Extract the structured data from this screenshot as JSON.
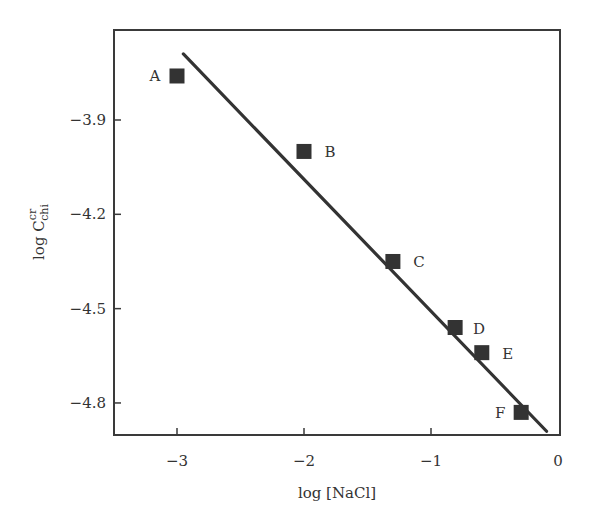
{
  "chart_data": {
    "type": "scatter",
    "title": "",
    "xlabel": "log [NaCl]",
    "ylabel": "log C_chi^cr",
    "ylabel_parts": {
      "base": "log C",
      "sup": "cr",
      "sub": "chi"
    },
    "xlim": [
      -3.5,
      0
    ],
    "ylim": [
      -4.9,
      -3.61
    ],
    "x_ticks": [
      -3,
      -2,
      -1,
      0
    ],
    "x_tick_labels": [
      "−3",
      "−2",
      "−1",
      "0"
    ],
    "y_ticks": [
      -3.9,
      -4.2,
      -4.5,
      -4.8
    ],
    "y_tick_labels": [
      "−3.9",
      "−4.2",
      "−4.5",
      "−4.8"
    ],
    "grid": false,
    "legend": null,
    "series": [
      {
        "name": "data",
        "marker": "filled-square",
        "color": "#333333",
        "points": [
          {
            "label": "A",
            "x": -3.0,
            "y": -3.76
          },
          {
            "label": "B",
            "x": -2.0,
            "y": -4.0
          },
          {
            "label": "C",
            "x": -1.3,
            "y": -4.35
          },
          {
            "label": "D",
            "x": -0.81,
            "y": -4.56
          },
          {
            "label": "E",
            "x": -0.6,
            "y": -4.64
          },
          {
            "label": "F",
            "x": -0.29,
            "y": -4.83
          }
        ]
      },
      {
        "name": "linear fit",
        "type": "line",
        "color": "#333333",
        "x": [
          -2.95,
          -0.09
        ],
        "y": [
          -3.69,
          -4.89
        ]
      }
    ]
  }
}
